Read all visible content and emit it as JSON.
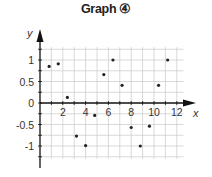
{
  "title": "Graph ④",
  "chart_data": {
    "type": "scatter",
    "title": "Graph ④",
    "xlabel": "x",
    "ylabel": "y",
    "xlim": [
      0,
      12.5
    ],
    "ylim": [
      -1.35,
      1.3
    ],
    "grid": true,
    "legend": null,
    "x_ticks": [
      2,
      4,
      6,
      8,
      10,
      12
    ],
    "x_tick_labels": [
      "2",
      "4",
      "6",
      "8",
      "10",
      "12"
    ],
    "y_ticks": [
      1,
      0.5,
      0,
      -0.5,
      -1
    ],
    "y_tick_labels": [
      "1",
      "0.5",
      "0",
      "-0.5",
      "-1"
    ],
    "points": [
      {
        "x": 0.8,
        "y": 0.85
      },
      {
        "x": 1.6,
        "y": 0.91
      },
      {
        "x": 2.4,
        "y": 0.13
      },
      {
        "x": 3.2,
        "y": -0.77
      },
      {
        "x": 4.0,
        "y": -0.99
      },
      {
        "x": 4.8,
        "y": -0.29
      },
      {
        "x": 5.6,
        "y": 0.66
      },
      {
        "x": 6.4,
        "y": 1.0
      },
      {
        "x": 7.2,
        "y": 0.41
      },
      {
        "x": 8.0,
        "y": -0.57
      },
      {
        "x": 8.8,
        "y": -1.0
      },
      {
        "x": 9.6,
        "y": -0.54
      },
      {
        "x": 10.4,
        "y": 0.41
      },
      {
        "x": 11.2,
        "y": 1.0
      }
    ],
    "colors": {
      "point": "#222222",
      "grid": "#c8c8c8",
      "axis": "#111111"
    }
  }
}
